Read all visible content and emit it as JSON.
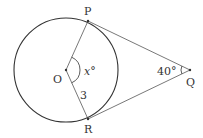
{
  "diagram": {
    "type": "circle-tangent-geometry",
    "colors": {
      "stroke": "#333333",
      "line": "#555555",
      "background": "#ffffff"
    },
    "circle": {
      "center_label": "O",
      "cx": 66,
      "cy": 70,
      "r": 52
    },
    "points": {
      "P": {
        "label": "P",
        "x": 88,
        "y": 21
      },
      "R": {
        "label": "R",
        "x": 88,
        "y": 119
      },
      "Q": {
        "label": "Q",
        "x": 190,
        "y": 70
      },
      "O": {
        "label": "O",
        "x": 66,
        "y": 70
      }
    },
    "labels": {
      "angle_O": "x°",
      "angle_Q": "40°",
      "radius_OR": "3"
    }
  }
}
